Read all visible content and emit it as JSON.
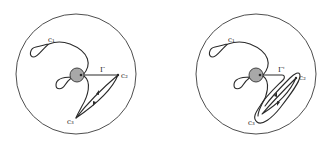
{
  "figure": {
    "panels": [
      {
        "id": "left",
        "labels": {
          "c1": "c₁",
          "c2": "c₂",
          "c3": "c₃",
          "path": "Γ"
        }
      },
      {
        "id": "right",
        "labels": {
          "c1": "c₁",
          "c2": "c₂",
          "c3": "c₃",
          "path": "Γ'"
        }
      }
    ],
    "colors": {
      "stroke": "#2a2a2a",
      "hole_fill": "#a8a8a8",
      "background": "#ffffff"
    }
  }
}
